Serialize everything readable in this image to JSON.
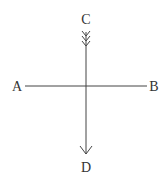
{
  "labels": {
    "a": "A",
    "b": "B",
    "c": "C",
    "d": "D"
  },
  "colors": {
    "stroke": "#444444",
    "text": "#333333"
  }
}
